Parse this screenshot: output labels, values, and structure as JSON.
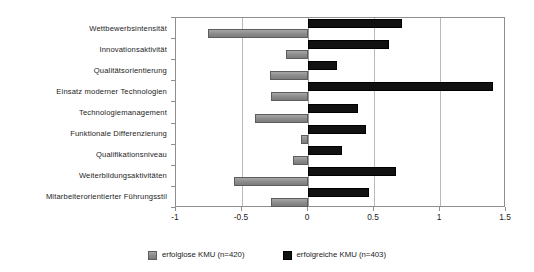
{
  "chart_data": {
    "type": "bar",
    "orientation": "horizontal",
    "title": "",
    "subtitle": "",
    "xlabel": "",
    "ylabel": "",
    "xlim": [
      -1,
      1.5
    ],
    "ylim": null,
    "grid": true,
    "legend_position": "bottom-center",
    "xticks": [
      "-1",
      "-0.5",
      "0",
      "0.5",
      "1",
      "1.5"
    ],
    "xtick_values": [
      -1,
      -0.5,
      0,
      0.5,
      1,
      1.5
    ],
    "categories": [
      "Wettbewerbsintensität",
      "Innovationsaktivität",
      "Qualitätsorientierung",
      "Einsatz moderner Technologien",
      "Technologiemanagement",
      "Funktionale Differenzierung",
      "Qualifikationsniveau",
      "Weiterbildungsaktivitäten",
      "Mitarbeiterorientierter Führungsstil"
    ],
    "series": [
      {
        "name": "erfolglose KMU (n=420)",
        "color": "#8f8f8f",
        "values": [
          -0.76,
          -0.17,
          -0.29,
          -0.28,
          -0.4,
          -0.05,
          -0.11,
          -0.56,
          -0.28
        ]
      },
      {
        "name": "erfolgreiche KMU (n=403)",
        "color": "#111111",
        "values": [
          0.71,
          0.61,
          0.22,
          1.4,
          0.38,
          0.44,
          0.26,
          0.67,
          0.46
        ]
      }
    ]
  },
  "legend": {
    "entries": [
      {
        "label": "erfolglose KMU (n=420)",
        "swatch": "gray-swatch-icon"
      },
      {
        "label": "erfolgreiche KMU (n=403)",
        "swatch": "black-swatch-icon"
      }
    ]
  }
}
